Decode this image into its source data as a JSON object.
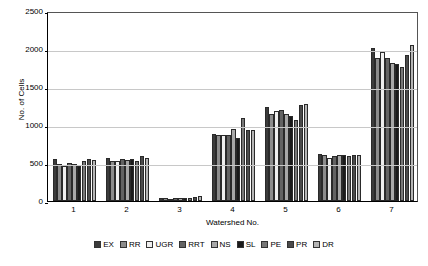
{
  "chart_data": {
    "type": "bar",
    "title": "",
    "xlabel": "Watershed No.",
    "ylabel": "No. of Cells",
    "categories": [
      "1",
      "2",
      "3",
      "4",
      "5",
      "6",
      "7"
    ],
    "ylim": [
      0,
      2500
    ],
    "yticks": [
      0,
      500,
      1000,
      1500,
      2000,
      2500
    ],
    "ytick_labels": [
      "0",
      "500",
      "1000",
      "1500",
      "2000",
      "2500"
    ],
    "grid": true,
    "legend_position": "bottom",
    "series": [
      {
        "name": "EX",
        "color": "#3b3b3b",
        "values": [
          556,
          570,
          38,
          888,
          1231,
          622,
          2013
        ]
      },
      {
        "name": "RR",
        "color": "#8c8c8c",
        "values": [
          482,
          523,
          34,
          871,
          1143,
          600,
          1880
        ]
      },
      {
        "name": "UGR",
        "color": "#efefef",
        "values": [
          455,
          520,
          33,
          869,
          1189,
          566,
          1966
        ]
      },
      {
        "name": "RRT",
        "color": "#636363",
        "values": [
          498,
          551,
          40,
          872,
          1199,
          595,
          1887
        ]
      },
      {
        "name": "NS",
        "color": "#a8a8a8",
        "values": [
          487,
          541,
          42,
          944,
          1144,
          604,
          1810
        ]
      },
      {
        "name": "SL",
        "color": "#1a1a1a",
        "values": [
          466,
          558,
          46,
          835,
          1120,
          600,
          1808
        ]
      },
      {
        "name": "PE",
        "color": "#777777",
        "values": [
          527,
          524,
          45,
          1088,
          1068,
          595,
          1760
        ]
      },
      {
        "name": "PR",
        "color": "#4a4a4a",
        "values": [
          547,
          588,
          47,
          928,
          1260,
          609,
          1927
        ]
      },
      {
        "name": "DR",
        "color": "#b5b5b5",
        "values": [
          543,
          568,
          66,
          930,
          1270,
          612,
          2058
        ]
      }
    ]
  }
}
